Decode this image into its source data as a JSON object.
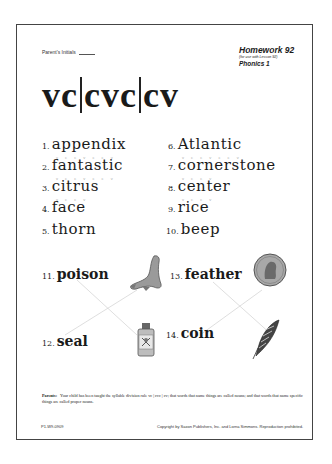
{
  "header": {
    "parent_initials_label": "Parent's Initials",
    "homework_title": "Homework 92",
    "lesson_note": "(for use with Lesson 92)",
    "subject": "Phonics 1"
  },
  "title": {
    "parts": [
      "vc",
      "cvc",
      "cv"
    ]
  },
  "word_list": [
    {
      "num": "1.",
      "word": "appendix",
      "marks": "v c c v c c v"
    },
    {
      "num": "2.",
      "word": "fantastic",
      "marks": "v c c v c c v"
    },
    {
      "num": "3.",
      "word": "citrus",
      "marks": "v c c v"
    },
    {
      "num": "4.",
      "word": "face",
      "marks": ""
    },
    {
      "num": "5.",
      "word": "thorn",
      "marks": ""
    },
    {
      "num": "6.",
      "word": "Atlantic",
      "marks": "v c c v c c v"
    },
    {
      "num": "7.",
      "word": "cornerstone",
      "marks": "v c c v"
    },
    {
      "num": "8.",
      "word": "center",
      "marks": "v c c v"
    },
    {
      "num": "9.",
      "word": "rice",
      "marks": ""
    },
    {
      "num": "10.",
      "word": "beep",
      "marks": ""
    }
  ],
  "matching": [
    {
      "num": "11.",
      "word": "poison",
      "picture": "seal-picture"
    },
    {
      "num": "12.",
      "word": "seal",
      "picture": "poison-bottle-picture"
    },
    {
      "num": "13.",
      "word": "feather",
      "picture": "penny-coin-picture"
    },
    {
      "num": "14.",
      "word": "coin",
      "picture": "feather-picture"
    }
  ],
  "parent_note": {
    "label": "Parents:",
    "text": "Your child has been taught the syllable division rule vc | cvc | cv; that words that name things are called nouns; and that words that name specific things are called proper nouns."
  },
  "footer": {
    "code": "P1-W9-0909",
    "copyright": "Copyright by Saxon Publishers, Inc. and Lorna Simmons. Reproduction prohibited."
  }
}
